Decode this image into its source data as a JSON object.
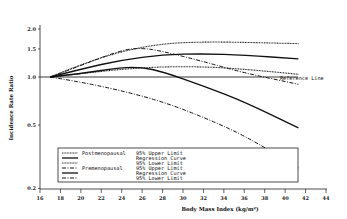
{
  "chart_data": {
    "type": "line",
    "title": "",
    "xlabel": "Body Mass Index (kg/m²)",
    "ylabel": "Incidence Rate Ratio",
    "xlim": [
      16,
      44
    ],
    "ylim": [
      0.2,
      2.0
    ],
    "yscale": "log",
    "x_ticks": [
      16,
      18,
      20,
      22,
      24,
      26,
      28,
      30,
      32,
      34,
      36,
      38,
      40,
      42,
      44
    ],
    "y_ticks": [
      {
        "value": 0.2,
        "label": "0.2"
      },
      {
        "value": 0.5,
        "label": "0.5"
      },
      {
        "value": 1.0,
        "label": "1.0"
      },
      {
        "value": 1.5,
        "label": "1.5"
      },
      {
        "value": 2.0,
        "label": "2.0"
      }
    ],
    "grid": false,
    "legend_position": "lower-left inside",
    "reference_line": {
      "value": 1.0,
      "label": "Reference Line"
    },
    "series": [
      {
        "name": "Postmenopausal 95% Upper Limit",
        "group": "Postmenopausal",
        "style": "dotted",
        "x": [
          17,
          20,
          24,
          28,
          32,
          36,
          41.3
        ],
        "values": [
          1.0,
          1.2,
          1.45,
          1.62,
          1.66,
          1.65,
          1.62
        ]
      },
      {
        "name": "Postmenopausal Regression Curve",
        "group": "Postmenopausal",
        "style": "solid",
        "x": [
          17,
          20,
          24,
          28,
          32,
          36,
          41.3
        ],
        "values": [
          1.0,
          1.12,
          1.28,
          1.38,
          1.4,
          1.37,
          1.3
        ]
      },
      {
        "name": "Postmenopausal 95% Lower Limit",
        "group": "Postmenopausal",
        "style": "dotted",
        "x": [
          17,
          20,
          24,
          28,
          32,
          36,
          41.3
        ],
        "values": [
          1.0,
          1.05,
          1.12,
          1.16,
          1.16,
          1.12,
          1.04
        ]
      },
      {
        "name": "Premenopausal 95% Upper Limit",
        "group": "Premenopausal",
        "style": "dashdot",
        "x": [
          17,
          20,
          24,
          26,
          28,
          32,
          36,
          41.3
        ],
        "values": [
          1.0,
          1.18,
          1.48,
          1.52,
          1.45,
          1.25,
          1.06,
          0.9
        ]
      },
      {
        "name": "Premenopausal Regression Curve",
        "group": "Premenopausal",
        "style": "solid",
        "x": [
          17,
          20,
          24,
          26,
          28,
          32,
          36,
          41.3
        ],
        "values": [
          1.0,
          1.05,
          1.15,
          1.15,
          1.08,
          0.88,
          0.7,
          0.48
        ]
      },
      {
        "name": "Premenopausal 95% Lower Limit",
        "group": "Premenopausal",
        "style": "dashdot",
        "x": [
          17,
          20,
          24,
          28,
          32,
          36,
          41.3
        ],
        "values": [
          1.0,
          0.93,
          0.82,
          0.7,
          0.56,
          0.43,
          0.27
        ]
      }
    ]
  },
  "legend": {
    "groups": [
      {
        "label": "Postmenopausal",
        "items": [
          "95% Upper Limit",
          "Regression Curve",
          "95% Lower Limit"
        ]
      },
      {
        "label": "Premenopausal",
        "items": [
          "95% Upper Limit",
          "Regression Curve",
          "95% Lower Limit"
        ]
      }
    ]
  }
}
